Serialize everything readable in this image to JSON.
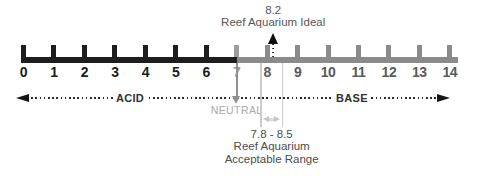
{
  "scale": {
    "min": 0,
    "max": 14,
    "tick_labels": [
      "0",
      "1",
      "2",
      "3",
      "4",
      "5",
      "6",
      "7",
      "8",
      "9",
      "10",
      "11",
      "12",
      "13",
      "14"
    ],
    "neutral_value": 7
  },
  "axis": {
    "acid_label": "ACID",
    "base_label": "BASE"
  },
  "annotations": {
    "ideal": {
      "value": 8.2,
      "value_label": "8.2",
      "caption": "Reef Aquarium Ideal"
    },
    "neutral": {
      "value": 7,
      "label": "NEUTRAL"
    },
    "acceptable_range": {
      "from": 7.8,
      "to": 8.5,
      "range_label": "7.8 - 8.5",
      "caption_line1": "Reef Aquarium",
      "caption_line2": "Acceptable Range"
    }
  },
  "colors": {
    "acid_bar": "#1e1e1e",
    "base_bar": "#8b8b8b",
    "neutral_gray": "#9c9c9c",
    "acid_number": "#1b1b1b",
    "base_number": "#5a5a5a",
    "neutral_number": "#9e9e9e",
    "neutral_text": "#a9a9a9",
    "annotation_text": "#565656",
    "caption_text": "#4d4d4d",
    "axis_color": "#2b2b2b",
    "range_line": "#cccccc",
    "range_arrow": "#c5c5c5"
  }
}
